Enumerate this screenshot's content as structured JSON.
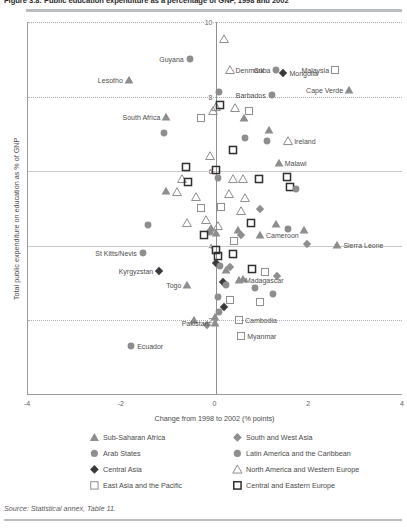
{
  "title": "Figure 3.8: Public education expenditure as a percentage of GNP, 1998 and 2002",
  "source": "Source: Statistical annex, Table 11.",
  "axes": {
    "ylabel": "Total public expenditure on education as % of GNP",
    "xlabel": "Change from 1998 to 2002 (% points)",
    "xticks": [
      "-4",
      "-2",
      "0",
      "2",
      "4"
    ],
    "yticks": [
      "2",
      "4",
      "6",
      "8",
      "10"
    ]
  },
  "legend": [
    {
      "label": "Sub-Saharan Africa",
      "glyph": "triangle-filled-grey",
      "color": "#a8a8a8"
    },
    {
      "label": "Arab States",
      "glyph": "circle-filled-grey",
      "color": "#8c8c8c"
    },
    {
      "label": "Central Asia",
      "glyph": "diamond-filled-dark",
      "color": "#3b3b3b"
    },
    {
      "label": "East Asia and the Pacific",
      "glyph": "square-open-light",
      "color": "#9a9a9a"
    },
    {
      "label": "South and West Asia",
      "glyph": "diamond-filled-grey",
      "color": "#8a8a8a"
    },
    {
      "label": "Latin America and the Caribbean",
      "glyph": "circle-filled-grey",
      "color": "#8c8c8c"
    },
    {
      "label": "North America and Western Europe",
      "glyph": "triangle-open-grey",
      "color": "#7d7d7d"
    },
    {
      "label": "Central and Eastern Europe",
      "glyph": "square-open-dark",
      "color": "#333333"
    }
  ],
  "chart_data": {
    "type": "scatter",
    "title": "Figure 3.8: Public education expenditure as a percentage of GNP, 1998 and 2002",
    "xlabel": "Change from 1998 to 2002 (% points)",
    "ylabel": "Total public expenditure on education as % of GNP",
    "xlim": [
      -4,
      4
    ],
    "ylim": [
      0,
      10
    ],
    "grid": true,
    "legend_position": "below",
    "series": [
      {
        "name": "Sub-Saharan Africa",
        "marker": "triangle-filled-grey"
      },
      {
        "name": "Arab States",
        "marker": "circle-filled-grey"
      },
      {
        "name": "Central Asia",
        "marker": "diamond-filled-dark"
      },
      {
        "name": "East Asia and the Pacific",
        "marker": "square-open-light"
      },
      {
        "name": "South and West Asia",
        "marker": "diamond-filled-grey"
      },
      {
        "name": "Latin America and the Caribbean",
        "marker": "circle-filled-grey"
      },
      {
        "name": "North America and Western Europe",
        "marker": "triangle-open-grey"
      },
      {
        "name": "Central and Eastern Europe",
        "marker": "square-open-dark"
      }
    ],
    "labeled_points": [
      {
        "name": "Guyana",
        "x": -0.55,
        "y": 9.0,
        "marker": "circle-filled-grey",
        "label_side": "left"
      },
      {
        "name": "Lesotho",
        "x": -1.85,
        "y": 8.45,
        "marker": "triangle-filled-grey",
        "label_side": "left"
      },
      {
        "name": "Denmark",
        "x": 0.3,
        "y": 8.7,
        "marker": "triangle-open-grey",
        "label_side": "right"
      },
      {
        "name": "Cuba",
        "x": 1.3,
        "y": 8.72,
        "marker": "circle-filled-grey",
        "label_side": "left"
      },
      {
        "name": "Mongolia",
        "x": 1.45,
        "y": 8.62,
        "marker": "diamond-filled-dark",
        "label_side": "right"
      },
      {
        "name": "Malaysia",
        "x": 2.55,
        "y": 8.72,
        "marker": "square-open-light",
        "label_side": "left"
      },
      {
        "name": "Barbados",
        "x": 1.2,
        "y": 8.05,
        "marker": "circle-filled-grey",
        "label_side": "left"
      },
      {
        "name": "Cape Verde",
        "x": 2.85,
        "y": 8.18,
        "marker": "triangle-filled-grey",
        "label_side": "left"
      },
      {
        "name": "South Africa",
        "x": -1.05,
        "y": 7.45,
        "marker": "triangle-filled-grey",
        "label_side": "left"
      },
      {
        "name": "Ireland",
        "x": 1.55,
        "y": 6.82,
        "marker": "triangle-open-grey",
        "label_side": "right"
      },
      {
        "name": "Malawi",
        "x": 1.35,
        "y": 6.22,
        "marker": "triangle-filled-grey",
        "label_side": "right"
      },
      {
        "name": "Cameroon",
        "x": 0.95,
        "y": 4.28,
        "marker": "triangle-filled-grey",
        "label_side": "right"
      },
      {
        "name": "Sierra Leone",
        "x": 2.6,
        "y": 4.02,
        "marker": "triangle-filled-grey",
        "label_side": "right"
      },
      {
        "name": "St Kitts/Nevis",
        "x": -1.55,
        "y": 3.8,
        "marker": "circle-filled-grey",
        "label_side": "left"
      },
      {
        "name": "Kyrgyzstan",
        "x": -1.2,
        "y": 3.32,
        "marker": "diamond-filled-dark",
        "label_side": "left"
      },
      {
        "name": "Togo",
        "x": -0.6,
        "y": 2.95,
        "marker": "triangle-filled-grey",
        "label_side": "left"
      },
      {
        "name": "Madagascar",
        "x": 0.5,
        "y": 3.08,
        "marker": "triangle-filled-grey",
        "label_side": "right"
      },
      {
        "name": "Cambodia",
        "x": 0.5,
        "y": 2.0,
        "marker": "square-open-light",
        "label_side": "right"
      },
      {
        "name": "Myanmar",
        "x": 0.55,
        "y": 1.58,
        "marker": "square-open-light",
        "label_side": "right"
      },
      {
        "name": "Pakistan",
        "x": -0.02,
        "y": 1.92,
        "marker": "triangle-filled-grey",
        "label_side": "left"
      },
      {
        "name": "Ecuador",
        "x": -1.8,
        "y": 1.32,
        "marker": "circle-filled-grey",
        "label_side": "right"
      }
    ],
    "unlabeled_points": [
      {
        "x": 0.08,
        "y": 8.12,
        "marker": "circle-filled-grey"
      },
      {
        "x": 0.0,
        "y": 7.72,
        "marker": "triangle-open-grey"
      },
      {
        "x": 0.1,
        "y": 7.78,
        "marker": "square-open-dark"
      },
      {
        "x": -0.06,
        "y": 7.62,
        "marker": "triangle-open-grey"
      },
      {
        "x": 0.42,
        "y": 7.7,
        "marker": "triangle-open-grey"
      },
      {
        "x": 0.72,
        "y": 7.62,
        "marker": "square-open-light"
      },
      {
        "x": -1.1,
        "y": 7.02,
        "marker": "circle-filled-grey"
      },
      {
        "x": -0.3,
        "y": 7.42,
        "marker": "square-open-light"
      },
      {
        "x": 0.6,
        "y": 7.42,
        "marker": "triangle-filled-grey"
      },
      {
        "x": 1.15,
        "y": 7.1,
        "marker": "triangle-filled-grey"
      },
      {
        "x": 0.62,
        "y": 6.9,
        "marker": "circle-filled-grey"
      },
      {
        "x": 1.1,
        "y": 6.82,
        "marker": "circle-filled-grey"
      },
      {
        "x": -0.62,
        "y": 6.1,
        "marker": "square-open-dark"
      },
      {
        "x": -0.72,
        "y": 5.78,
        "marker": "triangle-open-grey"
      },
      {
        "x": -0.58,
        "y": 5.7,
        "marker": "square-open-dark"
      },
      {
        "x": -1.05,
        "y": 5.48,
        "marker": "triangle-filled-grey"
      },
      {
        "x": -0.82,
        "y": 5.45,
        "marker": "triangle-open-grey"
      },
      {
        "x": 0.02,
        "y": 6.02,
        "marker": "square-open-dark"
      },
      {
        "x": 0.05,
        "y": 5.82,
        "marker": "circle-filled-grey"
      },
      {
        "x": 0.38,
        "y": 5.78,
        "marker": "triangle-open-grey"
      },
      {
        "x": 0.58,
        "y": 5.8,
        "marker": "triangle-open-grey"
      },
      {
        "x": 0.92,
        "y": 5.78,
        "marker": "square-open-dark"
      },
      {
        "x": 1.52,
        "y": 5.85,
        "marker": "square-open-dark"
      },
      {
        "x": 1.58,
        "y": 5.58,
        "marker": "square-open-dark"
      },
      {
        "x": 1.72,
        "y": 5.52,
        "marker": "circle-filled-grey"
      },
      {
        "x": -0.42,
        "y": 5.32,
        "marker": "triangle-open-grey"
      },
      {
        "x": 0.28,
        "y": 5.4,
        "marker": "triangle-open-grey"
      },
      {
        "x": 0.62,
        "y": 5.28,
        "marker": "triangle-open-grey"
      },
      {
        "x": -0.3,
        "y": 5.02,
        "marker": "square-open-light"
      },
      {
        "x": 0.12,
        "y": 5.05,
        "marker": "square-open-light"
      },
      {
        "x": 0.55,
        "y": 4.92,
        "marker": "triangle-open-grey"
      },
      {
        "x": 0.95,
        "y": 4.98,
        "marker": "diamond-filled-grey"
      },
      {
        "x": -1.45,
        "y": 4.55,
        "marker": "circle-filled-grey"
      },
      {
        "x": -0.6,
        "y": 4.62,
        "marker": "triangle-open-grey"
      },
      {
        "x": -0.2,
        "y": 4.68,
        "marker": "triangle-open-grey"
      },
      {
        "x": -0.1,
        "y": 4.48,
        "marker": "triangle-filled-grey"
      },
      {
        "x": 0.05,
        "y": 4.52,
        "marker": "triangle-open-grey"
      },
      {
        "x": -0.12,
        "y": 4.38,
        "marker": "circle-filled-grey"
      },
      {
        "x": 0.02,
        "y": 4.35,
        "marker": "triangle-filled-grey"
      },
      {
        "x": 0.75,
        "y": 4.62,
        "marker": "square-open-dark"
      },
      {
        "x": 0.48,
        "y": 4.42,
        "marker": "triangle-filled-grey"
      },
      {
        "x": 1.28,
        "y": 4.58,
        "marker": "triangle-filled-grey"
      },
      {
        "x": 1.55,
        "y": 4.45,
        "marker": "circle-filled-grey"
      },
      {
        "x": 1.88,
        "y": 4.42,
        "marker": "triangle-filled-grey"
      },
      {
        "x": 0.4,
        "y": 4.12,
        "marker": "square-open-light"
      },
      {
        "x": 1.95,
        "y": 4.05,
        "marker": "diamond-filled-grey"
      },
      {
        "x": 0.55,
        "y": 4.3,
        "marker": "diamond-filled-grey"
      },
      {
        "x": -0.25,
        "y": 4.28,
        "marker": "square-open-dark"
      },
      {
        "x": 0.02,
        "y": 3.88,
        "marker": "square-open-dark"
      },
      {
        "x": 0.05,
        "y": 3.72,
        "marker": "square-open-dark"
      },
      {
        "x": 0.38,
        "y": 3.78,
        "marker": "square-open-dark"
      },
      {
        "x": 0.02,
        "y": 3.55,
        "marker": "diamond-filled-dark"
      },
      {
        "x": 0.1,
        "y": 3.45,
        "marker": "circle-filled-grey"
      },
      {
        "x": 0.22,
        "y": 3.35,
        "marker": "triangle-filled-grey"
      },
      {
        "x": 0.3,
        "y": 3.42,
        "marker": "diamond-filled-grey"
      },
      {
        "x": 0.78,
        "y": 3.38,
        "marker": "square-open-dark"
      },
      {
        "x": 1.05,
        "y": 3.3,
        "marker": "square-open-light"
      },
      {
        "x": 1.32,
        "y": 3.2,
        "marker": "diamond-filled-grey"
      },
      {
        "x": 0.58,
        "y": 3.12,
        "marker": "triangle-filled-grey"
      },
      {
        "x": 0.15,
        "y": 3.02,
        "marker": "diamond-filled-dark"
      },
      {
        "x": 0.22,
        "y": 2.95,
        "marker": "circle-filled-grey"
      },
      {
        "x": 0.85,
        "y": 2.88,
        "marker": "circle-filled-grey"
      },
      {
        "x": 1.22,
        "y": 2.72,
        "marker": "circle-filled-grey"
      },
      {
        "x": 0.05,
        "y": 2.62,
        "marker": "circle-filled-grey"
      },
      {
        "x": 0.3,
        "y": 2.55,
        "marker": "square-open-light"
      },
      {
        "x": 0.95,
        "y": 2.48,
        "marker": "square-open-light"
      },
      {
        "x": 0.18,
        "y": 2.35,
        "marker": "diamond-filled-dark"
      },
      {
        "x": 0.08,
        "y": 2.22,
        "marker": "circle-filled-grey"
      },
      {
        "x": -0.02,
        "y": 2.08,
        "marker": "triangle-filled-grey"
      },
      {
        "x": -0.45,
        "y": 2.02,
        "marker": "triangle-filled-grey"
      },
      {
        "x": -0.18,
        "y": 1.88,
        "marker": "diamond-filled-grey"
      },
      {
        "x": 0.38,
        "y": 6.58,
        "marker": "square-open-dark"
      },
      {
        "x": -0.12,
        "y": 6.42,
        "marker": "triangle-open-grey"
      },
      {
        "x": 0.18,
        "y": 9.55,
        "marker": "triangle-open-grey"
      }
    ]
  }
}
